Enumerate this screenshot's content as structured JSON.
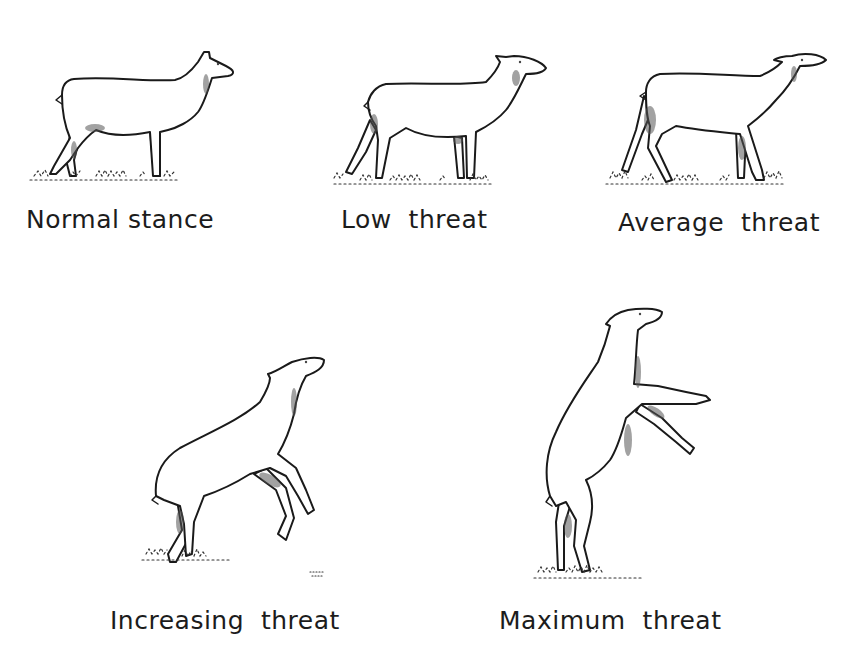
{
  "figure": {
    "ink_color": "#1a1a1a",
    "background": "#ffffff",
    "panels": [
      {
        "id": "normal",
        "label": "Normal stance",
        "posture": "standing-level"
      },
      {
        "id": "low",
        "label": "Low  threat",
        "posture": "standing-head-raised"
      },
      {
        "id": "average",
        "label": "Average  threat",
        "posture": "walking-head-raised"
      },
      {
        "id": "increasing",
        "label": "Increasing  threat",
        "posture": "half-rearing"
      },
      {
        "id": "maximum",
        "label": "Maximum  threat",
        "posture": "fully-rearing"
      }
    ]
  }
}
